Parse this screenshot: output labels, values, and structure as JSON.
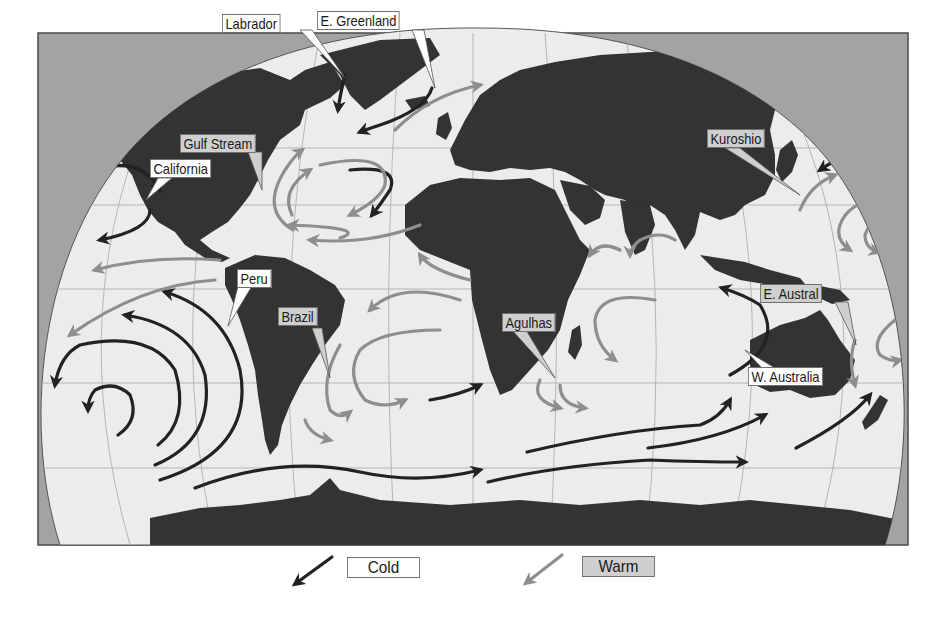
{
  "map": {
    "type": "ocean-currents-world-map",
    "colors": {
      "frame_background": "#a3a3a3",
      "ocean": "#ececec",
      "land": "#333333",
      "grid": "#b5b5b5",
      "cold_current": "#222222",
      "warm_current": "#8e8e8e",
      "cold_label_fill": "#ffffff",
      "warm_label_fill": "#cfcfcf"
    },
    "currents": [
      {
        "name": "Labrador",
        "type": "cold"
      },
      {
        "name": "E. Greenland",
        "type": "cold"
      },
      {
        "name": "Gulf Stream",
        "type": "warm"
      },
      {
        "name": "California",
        "type": "cold"
      },
      {
        "name": "Kuroshio",
        "type": "warm"
      },
      {
        "name": "Peru",
        "type": "cold"
      },
      {
        "name": "Brazil",
        "type": "warm"
      },
      {
        "name": "Agulhas",
        "type": "warm"
      },
      {
        "name": "E. Austral",
        "type": "warm"
      },
      {
        "name": "W. Australia",
        "type": "cold"
      }
    ]
  },
  "labels": {
    "labrador": "Labrador",
    "e_greenland": "E. Greenland",
    "gulf_stream": "Gulf Stream",
    "california": "California",
    "kuroshio": "Kuroshio",
    "peru": "Peru",
    "brazil": "Brazil",
    "agulhas": "Agulhas",
    "e_austral": "E. Austral",
    "w_australia": "W. Australia"
  },
  "legend": {
    "cold": {
      "label": "Cold",
      "color": "#222222"
    },
    "warm": {
      "label": "Warm",
      "color": "#8e8e8e"
    }
  }
}
